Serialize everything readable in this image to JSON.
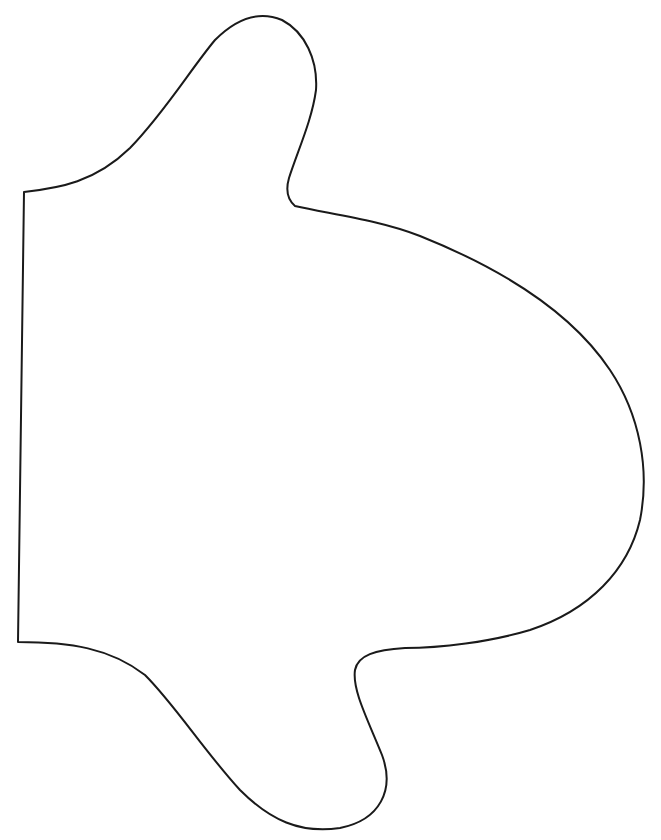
{
  "figure": {
    "stroke_color": "#1a1a1a",
    "background_color": "#ffffff",
    "stroke_width": 2
  },
  "caption": {
    "text": ""
  }
}
